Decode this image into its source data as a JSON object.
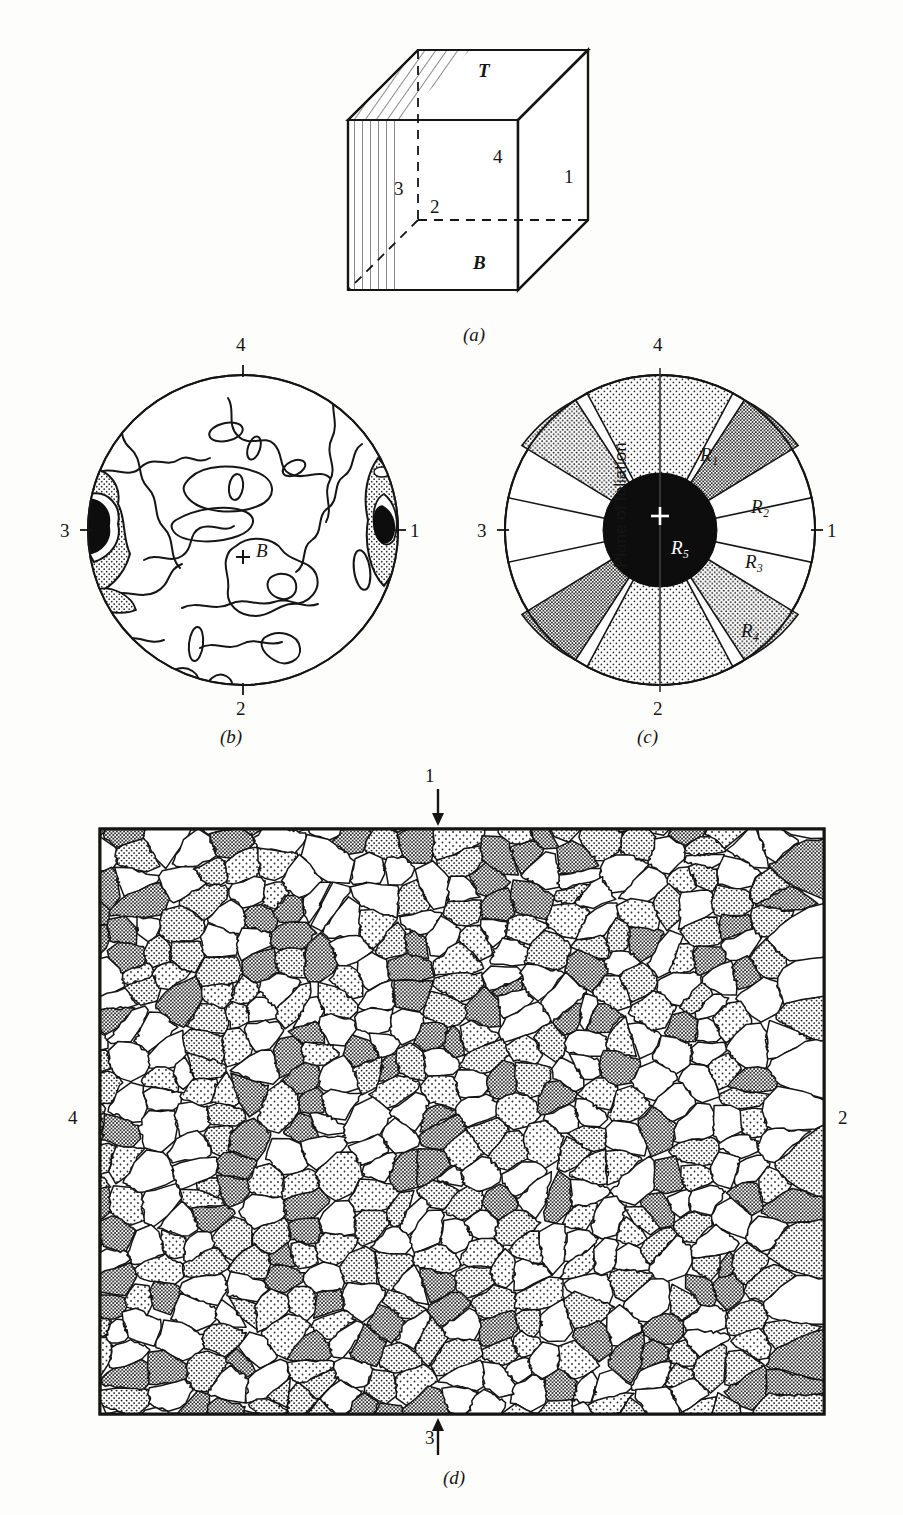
{
  "figure": {
    "panels": [
      {
        "id": "a",
        "caption": "(a)"
      },
      {
        "id": "b",
        "caption": "(b)"
      },
      {
        "id": "c",
        "caption": "(c)"
      },
      {
        "id": "d",
        "caption": "(d)"
      }
    ]
  },
  "panel_a": {
    "caption": "(a)",
    "face_labels": {
      "top": "T",
      "bottom": "B",
      "right": "1",
      "front": "4",
      "left_hidden": "3",
      "back_hidden": "2"
    }
  },
  "panel_b": {
    "caption": "(b)",
    "center_label": "B",
    "axis_labels": {
      "top": "4",
      "bottom": "2",
      "left": "3",
      "right": "1"
    },
    "chart_data": {
      "type": "contour",
      "title": "Orientation (fabric) diagram",
      "center_symbol": "+",
      "center_label": "B",
      "axis_labels": {
        "top": "4",
        "bottom": "2",
        "left": "3",
        "right": "1"
      },
      "maxima": [
        {
          "name": "left-maximum",
          "position": "3",
          "intensity": "highest",
          "fill": "black"
        },
        {
          "name": "right-maximum",
          "position": "1",
          "intensity": "highest",
          "fill": "black"
        }
      ],
      "contour_levels": [
        "low",
        "stippled",
        "black"
      ],
      "legend": []
    }
  },
  "panel_c": {
    "caption": "(c)",
    "axis_labels": {
      "top": "4",
      "bottom": "2",
      "left": "3",
      "right": "1"
    },
    "center_symbol": "+",
    "vertical_text": "Plane of foliation",
    "chart_data": {
      "type": "pie",
      "title": "Sector (rose) diagram of orientation regions",
      "categories": [
        "R1",
        "R2",
        "R3",
        "R4",
        "R5"
      ],
      "labels": [
        "R₁",
        "R₂",
        "R₃",
        "R₄",
        "R₅"
      ],
      "sectors": [
        {
          "label": "R₁",
          "start_deg": 62,
          "end_deg": 118,
          "shade": "light-stipple",
          "note": "upper sector, centred on 4 axis"
        },
        {
          "label": "R₂",
          "start_deg": 27,
          "end_deg": 57,
          "shade": "dense-stipple",
          "note": "upper-right sector"
        },
        {
          "label": "R₃",
          "start_deg": -12,
          "end_deg": 12,
          "shade": "white",
          "note": "sector centred on 1 axis"
        },
        {
          "label": "R₄",
          "start_deg": -57,
          "end_deg": -27,
          "shade": "medium-stipple",
          "note": "lower-right sector"
        },
        {
          "label": "R₅",
          "start_deg": 0,
          "end_deg": 360,
          "shade": "black",
          "note": "central disc"
        }
      ],
      "symmetry": "two-fold (sectors repeat on opposite side)",
      "inner_disc_label": "R₅",
      "inner_disc_fill": "#0d0d0d"
    }
  },
  "panel_d": {
    "caption": "(d)",
    "axis_labels": {
      "top": "1",
      "bottom": "3",
      "left": "4",
      "right": "2"
    },
    "arrows": {
      "top": "down-arrow",
      "bottom": "up-arrow"
    },
    "chart_data": {
      "type": "map",
      "title": "Grain-boundary microstructure map",
      "description": "Elongated grains forming a foliation inclined ~20 degrees from horizontal; grains shaded with four stipple densities plus white",
      "shade_classes": [
        "white",
        "light-stipple",
        "medium-stipple",
        "dense-stipple",
        "black"
      ],
      "foliation_angle_deg": 20,
      "grain_count_approx": 520
    }
  },
  "colors": {
    "ink": "#151515",
    "paper": "#fdfdfb",
    "black_fill": "#0d0d0d",
    "light_stipple": "#d9d9d9",
    "medium_stipple": "#b4b4b4",
    "dense_stipple": "#8e8e8e"
  }
}
